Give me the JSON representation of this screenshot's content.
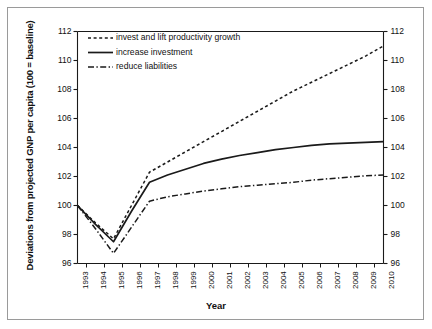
{
  "figure": {
    "axis_title_y": "Deviations from projected GNP per capita (100 = baseline)",
    "axis_title_x": "Year"
  },
  "legend": {
    "items": [
      {
        "label": "invest and lift productivity growth",
        "style": "dotted"
      },
      {
        "label": "increase investment",
        "style": "solid"
      },
      {
        "label": "reduce liabilities",
        "style": "dashdot"
      }
    ]
  },
  "axes": {
    "y_ticks": [
      "96",
      "98",
      "100",
      "102",
      "104",
      "106",
      "108",
      "110",
      "112"
    ],
    "y_ticks_right": [
      "96",
      "98",
      "100",
      "102",
      "104",
      "106",
      "108",
      "110",
      "112"
    ],
    "x_ticks": [
      "1993",
      "1994",
      "1995",
      "1996",
      "1997",
      "1998",
      "1999",
      "2000",
      "2001",
      "2002",
      "2003",
      "2004",
      "2005",
      "2006",
      "2007",
      "2008",
      "2009",
      "2010"
    ]
  },
  "chart_data": {
    "type": "line",
    "title": "",
    "xlabel": "Year",
    "ylabel": "Deviations from projected GNP per capita (100 = baseline)",
    "x": [
      1993,
      1994,
      1995,
      1996,
      1997,
      1998,
      1999,
      2000,
      2001,
      2002,
      2003,
      2004,
      2005,
      2006,
      2007,
      2008,
      2009,
      2010
    ],
    "xlim": [
      1993,
      2010
    ],
    "ylim": [
      96,
      112
    ],
    "grid": false,
    "legend_position": "upper-left-inside",
    "series": [
      {
        "name": "invest and lift productivity growth",
        "style": "dotted",
        "color": "#1a1a1a",
        "values": [
          100.0,
          98.8,
          97.7,
          100.0,
          102.3,
          103.0,
          103.7,
          104.4,
          105.1,
          105.8,
          106.5,
          107.2,
          107.9,
          108.5,
          109.1,
          109.7,
          110.3,
          111.0
        ]
      },
      {
        "name": "increase investment",
        "style": "solid",
        "color": "#1a1a1a",
        "values": [
          100.0,
          98.7,
          97.5,
          99.6,
          101.6,
          102.1,
          102.5,
          102.9,
          103.2,
          103.45,
          103.65,
          103.85,
          104.0,
          104.15,
          104.25,
          104.3,
          104.35,
          104.4
        ]
      },
      {
        "name": "reduce liabilities",
        "style": "dashdot",
        "color": "#1a1a1a",
        "values": [
          100.0,
          98.4,
          96.7,
          98.5,
          100.3,
          100.6,
          100.8,
          101.0,
          101.15,
          101.3,
          101.4,
          101.5,
          101.6,
          101.75,
          101.85,
          101.95,
          102.05,
          102.1
        ]
      }
    ]
  }
}
